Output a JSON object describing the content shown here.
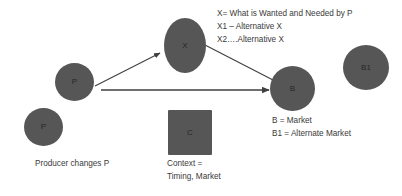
{
  "diagram": {
    "title_hidden": "",
    "background_color": "#ffffff",
    "node_fill_color": "#565656",
    "text_color": "#3a3a3a",
    "edge_color": "#3f3f3f",
    "nodes": [
      {
        "id": "p-upper",
        "label": "P",
        "shape": "circle",
        "x": 55,
        "y": 63,
        "w": 39,
        "h": 38
      },
      {
        "id": "p-lower",
        "label": "P",
        "shape": "circle",
        "x": 24,
        "y": 108,
        "w": 39,
        "h": 38
      },
      {
        "id": "x",
        "label": "X",
        "shape": "ellipse",
        "x": 164,
        "y": 18,
        "w": 42,
        "h": 55
      },
      {
        "id": "b",
        "label": "B",
        "shape": "circle",
        "x": 270,
        "y": 66,
        "w": 45,
        "h": 45
      },
      {
        "id": "b1",
        "label": "B1",
        "shape": "circle",
        "x": 343,
        "y": 45,
        "w": 46,
        "h": 45
      },
      {
        "id": "c",
        "label": "C",
        "shape": "square",
        "x": 168,
        "y": 110,
        "w": 44,
        "h": 45
      }
    ],
    "edges": [
      {
        "id": "p-to-x",
        "from": "p-upper",
        "to": "x",
        "arrow": true,
        "x1": 95,
        "y1": 86,
        "x2": 161,
        "y2": 53
      },
      {
        "id": "x-to-b",
        "from": "x",
        "to": "b",
        "arrow": false,
        "x1": 205,
        "y1": 45,
        "x2": 272,
        "y2": 79
      },
      {
        "id": "p-to-b",
        "from": "p-upper",
        "to": "b",
        "arrow": true,
        "x1": 101,
        "y1": 90,
        "x2": 270,
        "y2": 90
      }
    ]
  },
  "annotations": {
    "x_legend": {
      "line1": "X= What is Wanted and Needed by P",
      "line2": "X1 – Alternative X",
      "line3": "X2….Alternative X"
    },
    "b_legend": {
      "line1": "B = Market",
      "line2": "B1 = Alternate Market"
    },
    "producer_caption": "Producer changes P",
    "context_caption": {
      "line1": "Context =",
      "line2": "Timing, Market"
    }
  }
}
